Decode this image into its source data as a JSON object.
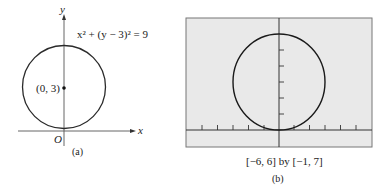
{
  "panel_a": {
    "equation": "x² + (y − 3)² = 9",
    "center_label": "(0, 3)",
    "origin_label": "O",
    "x_axis_label": "x",
    "y_axis_label": "y",
    "caption": "(a)"
  },
  "panel_b": {
    "window_label": "[−6, 6] by [−1, 7]",
    "caption": "(b)",
    "screen_bg": "#e9e9e9"
  },
  "colors": {
    "curve": "#1a1a1a",
    "axis": "#444444"
  }
}
